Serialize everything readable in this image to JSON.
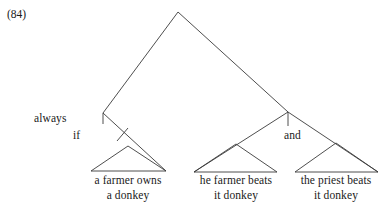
{
  "figure": {
    "example_number": "(84)",
    "caption": ""
  },
  "tree": {
    "type": "syntax-tree",
    "nodes": [
      {
        "id": "root",
        "label": "",
        "x": 178,
        "y": 12
      },
      {
        "id": "always-node",
        "label": "always",
        "label_x": 62,
        "label_y": 117,
        "x": 103,
        "y": 113
      },
      {
        "id": "if-node",
        "label": "if",
        "label_x": 80,
        "label_y": 133,
        "x": 128,
        "y": 128
      },
      {
        "id": "and-parent",
        "label": "",
        "x": 288,
        "y": 112
      },
      {
        "id": "and-node",
        "label": "and",
        "label_x": 298,
        "label_y": 133,
        "x": 288,
        "y": 128
      }
    ],
    "labels": {
      "always": "always",
      "if": "if",
      "and": "and"
    },
    "leaves": [
      {
        "id": "leaf-farmer-owns",
        "lines": [
          "a farmer owns",
          "a donkey"
        ],
        "apex_x": 128,
        "apex_y": 146,
        "base_left": 91,
        "base_right": 166,
        "base_y": 171
      },
      {
        "id": "leaf-farmer-beats",
        "lines": [
          "he farmer beats",
          "it donkey"
        ],
        "apex_x": 236,
        "apex_y": 144,
        "base_left": 194,
        "base_right": 277,
        "base_y": 172
      },
      {
        "id": "leaf-priest-beats",
        "lines": [
          "the priest beats",
          "it donkey"
        ],
        "apex_x": 336,
        "apex_y": 143,
        "base_left": 295,
        "base_right": 378,
        "base_y": 172
      }
    ]
  }
}
